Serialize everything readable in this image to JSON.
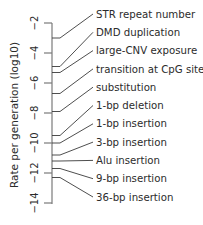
{
  "chart_data": {
    "type": "scatter",
    "title": "",
    "xlabel": "",
    "ylabel": "Rate per generation (log10)",
    "ylim": [
      -14,
      -2
    ],
    "yticks": [
      -2,
      -4,
      -6,
      -8,
      -10,
      -12,
      -14
    ],
    "ytick_labels": [
      "−2",
      "−4",
      "−6",
      "−8",
      "−10",
      "−12",
      "−14"
    ],
    "grid": false,
    "legend": "none; labels attached by leader lines on right",
    "points": [
      {
        "label": "STR repeat number",
        "value": -3.0
      },
      {
        "label": "DMD duplication",
        "value": -4.9
      },
      {
        "label": "large-CNV exposure",
        "value": -5.3
      },
      {
        "label": "transition at CpG site",
        "value": -6.7
      },
      {
        "label": "substitution",
        "value": -7.9
      },
      {
        "label": "1-bp deletion",
        "value": -9.5
      },
      {
        "label": "1-bp insertion",
        "value": -10.0
      },
      {
        "label": "3-bp insertion",
        "value": -10.8
      },
      {
        "label": "Alu insertion",
        "value": -11.2
      },
      {
        "label": "9-bp insertion",
        "value": -11.7
      },
      {
        "label": "36-bp insertion",
        "value": -12.3
      }
    ]
  },
  "colors": {
    "axis": "#7a7a7a",
    "text": "#2b2b2b",
    "leader": "#3a3a3a"
  }
}
